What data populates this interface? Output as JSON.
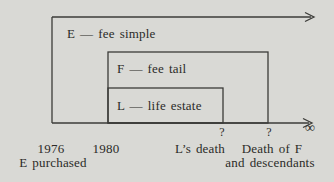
{
  "diagram": {
    "title_hint": "estates-in-land timeline diagram",
    "background_color": "#d9d9d5",
    "line_color": "#3b3b38",
    "text_color": "#2b2b28",
    "estates": [
      {
        "id": "E",
        "label": "E — fee simple"
      },
      {
        "id": "F",
        "label": "F — fee tail"
      },
      {
        "id": "L",
        "label": "L — life estate"
      }
    ],
    "timeline": {
      "ticks": [
        {
          "label": "1976",
          "sublabel": "E purchased"
        },
        {
          "label": "1980"
        },
        {
          "marker": "?",
          "label": "L’s death"
        },
        {
          "marker": "?",
          "label": "Death of F",
          "sublabel": "and descendants"
        },
        {
          "label": "∞"
        }
      ]
    }
  }
}
